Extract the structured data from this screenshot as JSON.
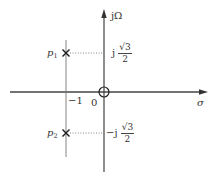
{
  "diagram": {
    "type": "pole-zero plot (s-plane)",
    "axes": {
      "horizontal_label": "σ",
      "vertical_label": "jΩ",
      "origin_label": "0",
      "tick_label_neg1": "−1"
    },
    "poles": [
      {
        "name": "p",
        "subscript": "1",
        "real": -1,
        "imag_label_prefix": "j",
        "imag_label_num": "√3",
        "imag_label_den": "2"
      },
      {
        "name": "p",
        "subscript": "2",
        "real": -1,
        "imag_label_prefix": "−j",
        "imag_label_num": "√3",
        "imag_label_den": "2"
      }
    ],
    "zeros": [
      {
        "real": 0,
        "imag": 0
      }
    ],
    "colors": {
      "axis": "#444444",
      "guide": "#777777",
      "marker": "#222222"
    }
  }
}
